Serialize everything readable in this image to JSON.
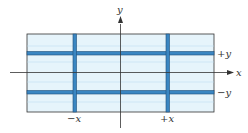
{
  "diagram": {
    "type": "coordinate-grid",
    "colors": {
      "fill": "#e6f4fb",
      "band": "#3a86c2",
      "band_edge": "#1f4f7a",
      "axis": "#333333",
      "border": "#333333",
      "label": "#333333"
    },
    "axes": {
      "x_label": "x",
      "y_label": "y"
    },
    "band_labels": {
      "plus_y": "+y",
      "minus_y": "−y",
      "minus_x": "−x",
      "plus_x": "+x"
    }
  }
}
